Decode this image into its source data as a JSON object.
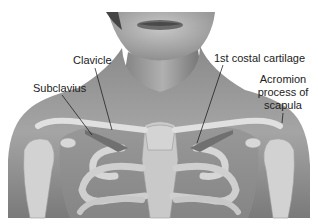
{
  "figure": {
    "labels": {
      "clavicle": "Clavicle",
      "subclavius": "Subclavius",
      "costal_cartilage": "1st costal cartilage",
      "acromion_line1": "Acromion",
      "acromion_line2": "process of",
      "acromion_line3": "scapula"
    },
    "colors": {
      "background": "#ffffff",
      "skin_dark": "#6e6e6e",
      "skin_mid": "#9a9a9a",
      "bone": "#d8d8d8",
      "label_text": "#222222",
      "leader_line": "#111111"
    }
  }
}
